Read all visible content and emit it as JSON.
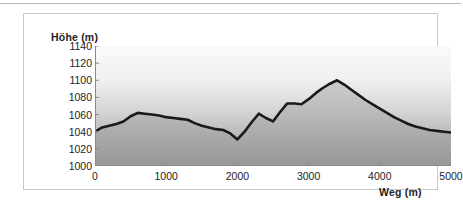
{
  "chart_data": {
    "type": "area",
    "title": "",
    "subtitle": "",
    "xlabel": "Weg (m)",
    "ylabel": "Höhe (m)",
    "xlim": [
      0,
      5000
    ],
    "ylim": [
      1000,
      1140
    ],
    "xticks": [
      0,
      1000,
      2000,
      3000,
      4000,
      5000
    ],
    "yticks": [
      1000,
      1020,
      1040,
      1060,
      1080,
      1100,
      1120,
      1140
    ],
    "xtick_labels": [
      "0",
      "1000",
      "2000",
      "3000",
      "4000",
      "5000"
    ],
    "ytick_labels": [
      "1000",
      "1020",
      "1040",
      "1060",
      "1080",
      "1100",
      "1120",
      "1140"
    ],
    "grid": false,
    "legend": "none",
    "series": [
      {
        "name": "Höhenprofil",
        "color": "#1a1a1a",
        "line_width": 2.6,
        "x": [
          0,
          100,
          200,
          300,
          400,
          500,
          600,
          700,
          800,
          900,
          1000,
          1100,
          1200,
          1300,
          1400,
          1500,
          1600,
          1700,
          1800,
          1900,
          2000,
          2100,
          2200,
          2300,
          2400,
          2500,
          2600,
          2700,
          2800,
          2900,
          3000,
          3100,
          3200,
          3300,
          3400,
          3500,
          3600,
          3700,
          3800,
          3900,
          4000,
          4100,
          4200,
          4300,
          4400,
          4500,
          4600,
          4700,
          4800,
          4900,
          5000
        ],
        "y": [
          1040,
          1045,
          1047,
          1049,
          1052,
          1058,
          1062,
          1061,
          1060,
          1059,
          1057,
          1056,
          1055,
          1054,
          1050,
          1047,
          1045,
          1043,
          1042,
          1038,
          1031,
          1040,
          1051,
          1061,
          1056,
          1052,
          1063,
          1073,
          1073,
          1072,
          1078,
          1085,
          1091,
          1096,
          1100,
          1095,
          1089,
          1083,
          1077,
          1072,
          1067,
          1062,
          1057,
          1053,
          1049,
          1046,
          1044,
          1042,
          1041,
          1040,
          1039
        ]
      }
    ],
    "background": {
      "plot_gradient_top": "#f6f6f6",
      "plot_gradient_bottom": "#9e9e9e",
      "under_curve_shade": "#8f8f8f",
      "axis_color": "#8a8a8a",
      "panel_border": "#c9c9c9",
      "text_color": "#222222"
    }
  },
  "axis_titles": {
    "y": "Höhe (m)",
    "x": "Weg (m)"
  }
}
